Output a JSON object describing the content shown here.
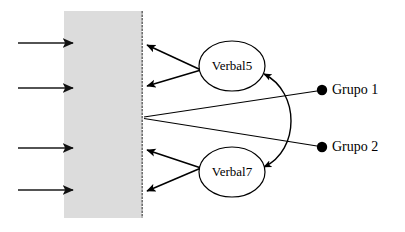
{
  "diagram": {
    "type": "sem-path-diagram",
    "title": "",
    "background_color": "#ffffff",
    "panel": {
      "name": "measurement-panel",
      "fill_color": "#dcdcdc",
      "edge_color": "#6f6f6f",
      "x": 64,
      "y": 11,
      "width": 78,
      "height": 207
    },
    "latent_variables": [
      {
        "id": "verbal5",
        "label": "Verbal5",
        "cx": 232,
        "cy": 66,
        "rx": 33,
        "ry": 25
      },
      {
        "id": "verbal7",
        "label": "Verbal7",
        "cx": 232,
        "cy": 172,
        "rx": 33,
        "ry": 25
      }
    ],
    "groups": [
      {
        "id": "grupo1",
        "label": "Grupo 1",
        "dot_x": 322,
        "dot_y": 90,
        "dot_radius": 5,
        "label_x": 333,
        "label_y": 91
      },
      {
        "id": "grupo2",
        "label": "Grupo 2",
        "dot_x": 322,
        "dot_y": 147,
        "dot_radius": 5,
        "label_x": 333,
        "label_y": 148
      }
    ],
    "indicator_arrows": [
      {
        "id": "indicator-1",
        "x1": 18,
        "y1": 43,
        "x2": 75,
        "y2": 43
      },
      {
        "id": "indicator-2",
        "x1": 18,
        "y1": 88,
        "x2": 75,
        "y2": 88
      },
      {
        "id": "indicator-3",
        "x1": 18,
        "y1": 148,
        "x2": 75,
        "y2": 148
      },
      {
        "id": "indicator-4",
        "x1": 18,
        "y1": 190,
        "x2": 75,
        "y2": 190
      }
    ],
    "loading_paths": [
      {
        "id": "loading-verbal5-a",
        "from": "verbal5",
        "x1": 200,
        "y1": 70,
        "x2": 146,
        "y2": 45
      },
      {
        "id": "loading-verbal5-b",
        "from": "verbal5",
        "x1": 200,
        "y1": 70,
        "x2": 146,
        "y2": 86
      },
      {
        "id": "loading-verbal7-a",
        "from": "verbal7",
        "x1": 200,
        "y1": 168,
        "x2": 146,
        "y2": 150
      },
      {
        "id": "loading-verbal7-b",
        "from": "verbal7",
        "x1": 200,
        "y1": 168,
        "x2": 146,
        "y2": 191
      }
    ],
    "group_paths": [
      {
        "id": "group1-path",
        "from": "grupo1",
        "x1": 318,
        "y1": 91,
        "x2": 144,
        "y2": 117
      },
      {
        "id": "group2-path",
        "from": "grupo2",
        "x1": 318,
        "y1": 146,
        "x2": 144,
        "y2": 118
      }
    ],
    "correlation_arc": {
      "id": "verbal5-verbal7-correlation",
      "double_headed": true,
      "start_x": 265,
      "start_y": 72,
      "end_x": 265,
      "end_y": 168,
      "control_x": 318,
      "control_y": 120
    }
  }
}
